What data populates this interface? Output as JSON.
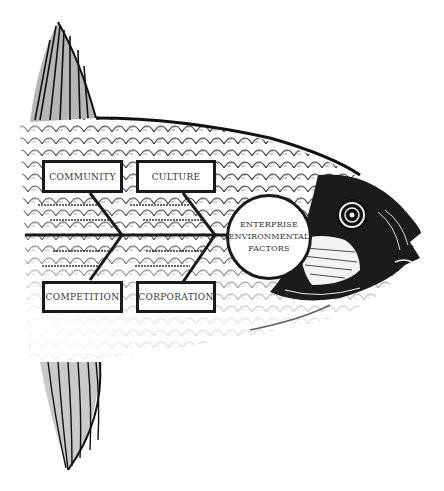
{
  "diagram": {
    "type": "fishbone",
    "effect": {
      "lines": [
        "ENTERPRISE",
        "ENVIRONMENTAL",
        "FACTORS"
      ]
    },
    "categories": [
      {
        "id": "community",
        "label": "COMMUNITY",
        "position": "top-left"
      },
      {
        "id": "culture",
        "label": "CULTURE",
        "position": "top-right"
      },
      {
        "id": "competition",
        "label": "COMPETITION",
        "position": "bottom-left"
      },
      {
        "id": "corporation",
        "label": "CORPORATION",
        "position": "bottom-right"
      }
    ],
    "illustration": "fish-engraving",
    "colors": {
      "ink": "#1a1a1a",
      "text": "#333333",
      "background": "#ffffff"
    }
  }
}
